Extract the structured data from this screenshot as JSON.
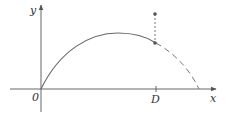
{
  "diagram": {
    "type": "projectile-trajectory",
    "colors": {
      "stroke": "#666666",
      "text": "#333333",
      "background": "#ffffff"
    },
    "axes": {
      "x_label": "x",
      "y_label": "y",
      "origin_label": "0"
    },
    "markers": {
      "d_label": "D"
    },
    "curve": {
      "solid_segment": "origin to D",
      "dashed_segment": "D to landing on x-axis"
    },
    "vertical_segment": {
      "style": "dashed",
      "from": "point above curve at D",
      "to": "curve at D"
    }
  }
}
